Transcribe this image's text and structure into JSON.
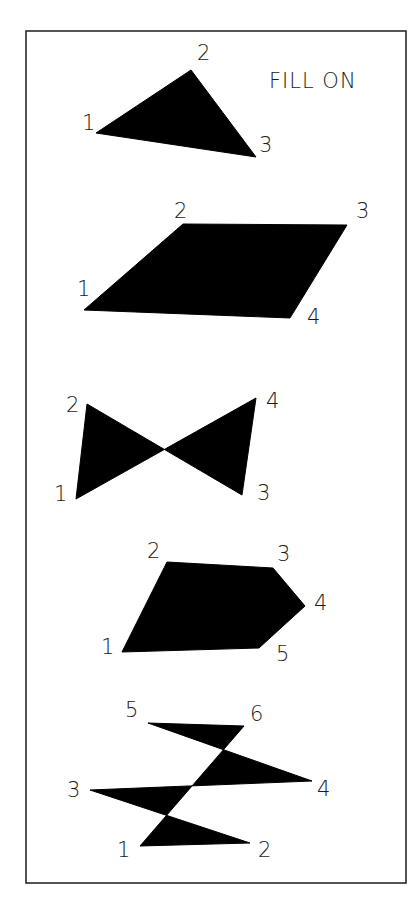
{
  "title": "FILL ON",
  "colors": {
    "fill": "#000000",
    "frame": "#2a2a2a",
    "background": "#ffffff",
    "text": "#1a1a1a"
  },
  "frame": {
    "x": 26,
    "y": 31,
    "width": 380,
    "height": 852
  },
  "shapes": [
    {
      "name": "triangle",
      "vertices": [
        {
          "label": "1",
          "x": 96,
          "y": 133,
          "lx": 82,
          "ly": 130
        },
        {
          "label": "2",
          "x": 191,
          "y": 70,
          "lx": 197,
          "ly": 60
        },
        {
          "label": "3",
          "x": 256,
          "y": 157,
          "lx": 259,
          "ly": 152
        }
      ]
    },
    {
      "name": "bowtie",
      "vertices": [
        {
          "label": "1",
          "x": 84,
          "y": 310,
          "lx": 77,
          "ly": 296
        },
        {
          "label": "2",
          "x": 183,
          "y": 224,
          "lx": 174,
          "ly": 218
        },
        {
          "label": "3",
          "x": 347,
          "y": 225,
          "lx": 356,
          "ly": 218
        },
        {
          "label": "4",
          "x": 290,
          "y": 318,
          "lx": 307,
          "ly": 324
        }
      ]
    },
    {
      "name": "quadrilateral",
      "vertices": [
        {
          "label": "1",
          "x": 76,
          "y": 499,
          "lx": 54,
          "ly": 501
        },
        {
          "label": "2",
          "x": 87,
          "y": 404,
          "lx": 66,
          "ly": 412
        },
        {
          "label": "3",
          "x": 242,
          "y": 495,
          "lx": 257,
          "ly": 500
        },
        {
          "label": "4",
          "x": 256,
          "y": 398,
          "lx": 266,
          "ly": 408
        }
      ]
    },
    {
      "name": "open-pentagon",
      "vertices": [
        {
          "label": "1",
          "x": 122,
          "y": 652,
          "lx": 101,
          "ly": 654
        },
        {
          "label": "2",
          "x": 167,
          "y": 562,
          "lx": 147,
          "ly": 558
        },
        {
          "label": "3",
          "x": 273,
          "y": 568,
          "lx": 277,
          "ly": 561
        },
        {
          "label": "4",
          "x": 305,
          "y": 606,
          "lx": 314,
          "ly": 610
        },
        {
          "label": "5",
          "x": 259,
          "y": 648,
          "lx": 276,
          "ly": 661
        }
      ]
    },
    {
      "name": "hexagon",
      "vertices": [
        {
          "label": "1",
          "x": 140,
          "y": 846,
          "lx": 117,
          "ly": 857
        },
        {
          "label": "2",
          "x": 250,
          "y": 843,
          "lx": 258,
          "ly": 857
        },
        {
          "label": "3",
          "x": 90,
          "y": 790,
          "lx": 67,
          "ly": 797
        },
        {
          "label": "4",
          "x": 312,
          "y": 781,
          "lx": 317,
          "ly": 796
        },
        {
          "label": "5",
          "x": 148,
          "y": 723,
          "lx": 125,
          "ly": 717
        },
        {
          "label": "6",
          "x": 244,
          "y": 726,
          "lx": 250,
          "ly": 721
        }
      ]
    }
  ]
}
